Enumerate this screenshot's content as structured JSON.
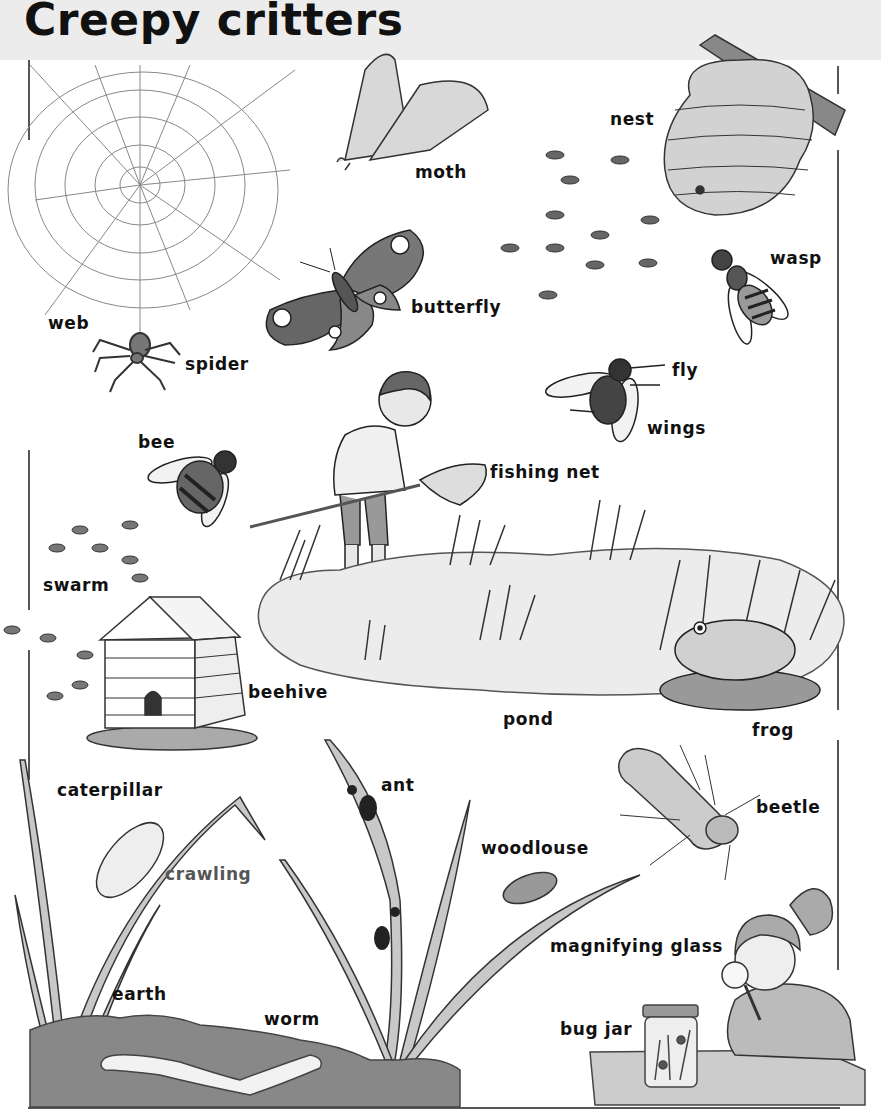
{
  "page": {
    "title": "Creepy critters"
  },
  "labels": {
    "web": "web",
    "spider": "spider",
    "moth": "moth",
    "butterfly": "butterfly",
    "nest": "nest",
    "wasp": "wasp",
    "fly": "fly",
    "wings": "wings",
    "bee": "bee",
    "fishing_net": "fishing net",
    "swarm": "swarm",
    "beehive": "beehive",
    "pond": "pond",
    "frog": "frog",
    "caterpillar": "caterpillar",
    "crawling": "crawling",
    "ant": "ant",
    "woodlouse": "woodlouse",
    "beetle": "beetle",
    "earth": "earth",
    "worm": "worm",
    "magnifying_glass": "magnifying glass",
    "bug_jar": "bug jar"
  },
  "colors": {
    "header_bg": "#ececec",
    "text": "#111111",
    "muted_text": "#555555"
  }
}
